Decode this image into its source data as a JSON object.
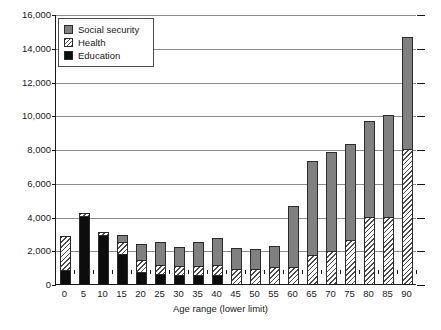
{
  "chart_data": {
    "type": "bar",
    "stacked": true,
    "title": "",
    "subtitle": "",
    "xlabel": "Age range (lower limit)",
    "ylabel": "",
    "grid": true,
    "legend_position": "top-left-inside",
    "ylim": [
      0,
      16000
    ],
    "ytick_step": 2000,
    "ytick_labels": [
      "0",
      "2,000",
      "4,000",
      "6,000",
      "8,000",
      "10,000",
      "12,000",
      "14,000",
      "16,000"
    ],
    "ytick_values": [
      0,
      2000,
      4000,
      6000,
      8000,
      10000,
      12000,
      14000,
      16000
    ],
    "categories": [
      "0",
      "5",
      "10",
      "15",
      "20",
      "25",
      "30",
      "35",
      "40",
      "45",
      "50",
      "55",
      "60",
      "65",
      "70",
      "75",
      "80",
      "85",
      "90"
    ],
    "series": [
      {
        "name": "Education",
        "color": "#0d0d0d",
        "pattern": "solid-black",
        "values": [
          850,
          4050,
          2900,
          1800,
          700,
          600,
          550,
          550,
          550,
          0,
          0,
          0,
          0,
          0,
          0,
          0,
          0,
          0,
          0
        ]
      },
      {
        "name": "Health",
        "color": "#f2f2f2",
        "pattern": "diagonal-hatch",
        "values": [
          2000,
          150,
          200,
          700,
          700,
          500,
          500,
          500,
          550,
          900,
          900,
          1000,
          1000,
          1700,
          1950,
          2600,
          3950,
          3950,
          8000
        ]
      },
      {
        "name": "Social security",
        "color": "#808080",
        "pattern": "solid-gray",
        "values": [
          0,
          0,
          0,
          400,
          950,
          1400,
          1150,
          1450,
          1600,
          1250,
          1150,
          1250,
          3650,
          5600,
          5900,
          5700,
          5700,
          6050,
          6650
        ]
      }
    ],
    "totals": [
      2850,
      4200,
      3100,
      2900,
      2350,
      2500,
      2200,
      2500,
      2700,
      2150,
      2050,
      2250,
      4650,
      7300,
      7850,
      8300,
      9650,
      10000,
      14650
    ]
  },
  "legend": {
    "items": [
      {
        "label": "Social security",
        "swatch": "social-security-swatch"
      },
      {
        "label": "Health",
        "swatch": "health-swatch"
      },
      {
        "label": "Education",
        "swatch": "education-swatch"
      }
    ]
  },
  "axes": {
    "x_title": "Age range (lower limit)"
  },
  "source_note": ""
}
